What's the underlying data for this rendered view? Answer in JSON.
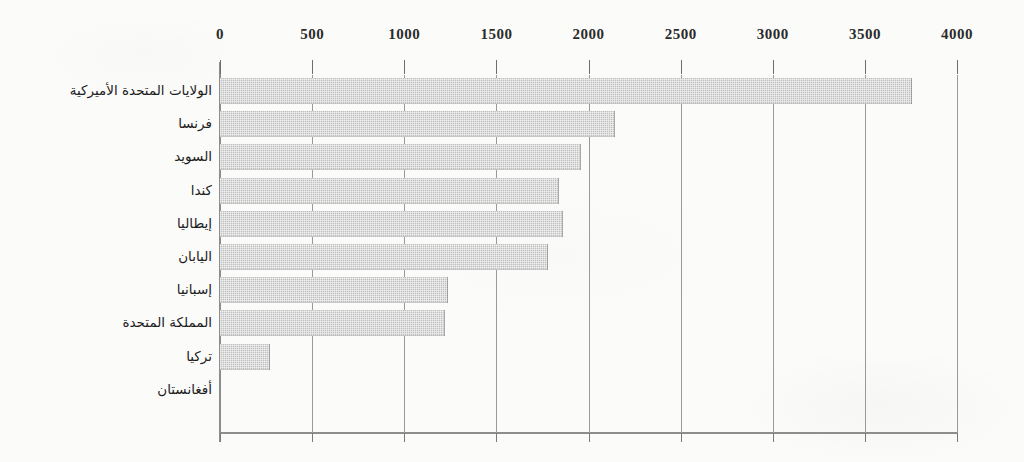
{
  "chart_data": {
    "type": "bar",
    "orientation": "horizontal",
    "title": "",
    "subtitle": "",
    "xlabel": "",
    "ylabel": "",
    "xlim": [
      0,
      4000
    ],
    "xticks": [
      0,
      500,
      1000,
      1500,
      2000,
      2500,
      3000,
      3500,
      4000
    ],
    "xtick_labels": [
      "0",
      "500",
      "1000",
      "1500",
      "2000",
      "2500",
      "3000",
      "3500",
      "4000"
    ],
    "grid": true,
    "grid_axis": "x",
    "legend": false,
    "legend_position": "none",
    "axis_position": "top",
    "categories": [
      "الولايات المتحدة الأميركية",
      "فرنسا",
      "السويد",
      "كندا",
      "إيطاليا",
      "اليابان",
      "إسبانيا",
      "المملكة المتحدة",
      "تركيا",
      "أفغانستان"
    ],
    "values": [
      3755,
      2143,
      1959,
      1840,
      1860,
      1780,
      1237,
      1221,
      271,
      0
    ],
    "bars": [
      {
        "label": "الولايات المتحدة الأميركية",
        "value": 3755
      },
      {
        "label": "فرنسا",
        "value": 2143
      },
      {
        "label": "السويد",
        "value": 1959
      },
      {
        "label": "كندا",
        "value": 1840
      },
      {
        "label": "إيطاليا",
        "value": 1860
      },
      {
        "label": "اليابان",
        "value": 1780
      },
      {
        "label": "إسبانيا",
        "value": 1237
      },
      {
        "label": "المملكة المتحدة",
        "value": 1221
      },
      {
        "label": "تركيا",
        "value": 271
      },
      {
        "label": "أفغانستان",
        "value": 0
      }
    ],
    "colors": {
      "bar_fill": "#bfbfbf",
      "axis": "#8d8d8d",
      "grid": "#9a9a9a",
      "text": "#1e1e1e",
      "background": "#fbfbfa"
    }
  }
}
